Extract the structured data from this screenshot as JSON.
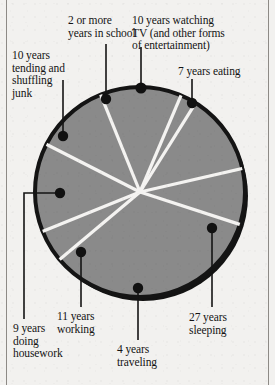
{
  "figure": {
    "kind": "pie-chart-illustration",
    "background_color": "#f2f1ef",
    "slice_fill": "#8a8a8a",
    "slice_divider_color": "#f4f3f1",
    "outline_color": "#141414",
    "marker_color": "#111111",
    "leader_color": "#141414"
  },
  "rules": {
    "left_label": "left-margin-rule",
    "right_label": "right-margin-rule"
  },
  "labels": {
    "school": "2 or more\nyears in school",
    "tv": "10 years watching\nTV (and other forms\nof entertainment)",
    "junk": "10 years\ntending and\nshuffling\njunk",
    "eating": "7 years eating",
    "housework": "9 years\ndoing\nhousework",
    "working": "11 years\nworking",
    "traveling": "4 years\ntraveling",
    "sleeping": "27 years\nsleeping"
  },
  "chart_data": {
    "type": "pie",
    "title": "",
    "unit": "years",
    "total": 80,
    "legend_position": "callout-labels",
    "grid": false,
    "categories": [
      "27 years sleeping",
      "11 years working",
      "10 years watching TV (and other forms of entertainment)",
      "10 years tending and shuffling junk",
      "9 years doing housework",
      "7 years eating",
      "4 years traveling",
      "2 or more years in school"
    ],
    "values": [
      27,
      11,
      10,
      10,
      9,
      7,
      4,
      2
    ],
    "labels": [
      "27 years\nsleeping",
      "11 years\nworking",
      "10 years watching\nTV (and other forms\nof entertainment)",
      "10 years\ntending and\nshuffling\njunk",
      "9 years\ndoing\nhousework",
      "7 years eating",
      "4 years\ntraveling",
      "2 or more\nyears in school"
    ],
    "slices": [
      {
        "name": "27 years sleeping",
        "value": 27,
        "start_deg": 18,
        "end_deg": 140
      },
      {
        "name": "4 years traveling",
        "value": 4,
        "start_deg": 140,
        "end_deg": 158
      },
      {
        "name": "11 years working",
        "value": 11,
        "start_deg": 158,
        "end_deg": 207
      },
      {
        "name": "9 years doing housework",
        "value": 9,
        "start_deg": 207,
        "end_deg": 248
      },
      {
        "name": "10 years tending and shuffling junk",
        "value": 10,
        "start_deg": 248,
        "end_deg": 293
      },
      {
        "name": "2 or more years in school",
        "value": 2,
        "start_deg": 293,
        "end_deg": 302
      },
      {
        "name": "10 years watching TV (and other forms of entertainment)",
        "value": 10,
        "start_deg": 302,
        "end_deg": 347
      },
      {
        "name": "7 years eating",
        "value": 7,
        "start_deg": 347,
        "end_deg": 378
      }
    ]
  }
}
